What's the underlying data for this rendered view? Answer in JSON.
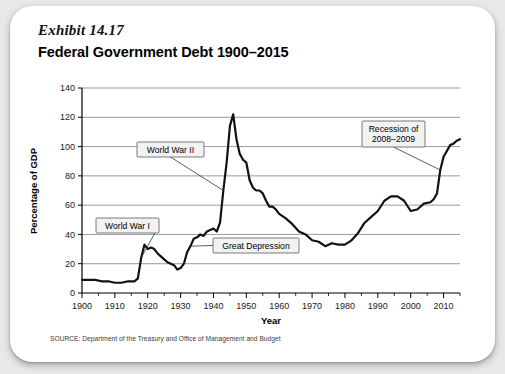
{
  "figure": {
    "exhibit_label": "Exhibit 14.17",
    "title": "Federal Government Debt 1900–2015",
    "source_note": "SOURCE: Department of the Treasury and Office of Management and Budget"
  },
  "chart_data": {
    "type": "line",
    "title": "Federal Government Debt 1900–2015",
    "xlabel": "Year",
    "ylabel": "Percentage of GDP",
    "xlim": [
      1900,
      2015
    ],
    "ylim": [
      0,
      140
    ],
    "ytick_labels": [
      "0",
      "20",
      "40",
      "60",
      "80",
      "100",
      "120",
      "140"
    ],
    "yticks": [
      0,
      20,
      40,
      60,
      80,
      100,
      120,
      140
    ],
    "xtick_labels": [
      "1900",
      "1910",
      "1920",
      "1930",
      "1940",
      "1950",
      "1960",
      "1970",
      "1980",
      "1990",
      "2000",
      "2010"
    ],
    "xticks": [
      1900,
      1910,
      1920,
      1930,
      1940,
      1950,
      1960,
      1970,
      1980,
      1990,
      2000,
      2010
    ],
    "x_minor_tick_step": 5,
    "grid": "horizontal",
    "legend": "none",
    "series": [
      {
        "name": "Federal Government Debt as Percentage of GDP",
        "x": [
          1900,
          1902,
          1904,
          1906,
          1908,
          1910,
          1912,
          1914,
          1916,
          1917,
          1918,
          1919,
          1920,
          1921,
          1922,
          1923,
          1924,
          1925,
          1926,
          1927,
          1928,
          1929,
          1930,
          1931,
          1932,
          1933,
          1934,
          1935,
          1936,
          1937,
          1938,
          1939,
          1940,
          1941,
          1942,
          1943,
          1944,
          1945,
          1946,
          1947,
          1948,
          1949,
          1950,
          1951,
          1952,
          1953,
          1954,
          1955,
          1956,
          1957,
          1958,
          1959,
          1960,
          1962,
          1964,
          1966,
          1968,
          1970,
          1972,
          1974,
          1976,
          1978,
          1980,
          1982,
          1984,
          1986,
          1988,
          1990,
          1992,
          1994,
          1996,
          1998,
          2000,
          2002,
          2004,
          2006,
          2007,
          2008,
          2009,
          2010,
          2011,
          2012,
          2013,
          2014,
          2015
        ],
        "y": [
          9,
          9,
          9,
          8,
          8,
          7,
          7,
          8,
          8,
          10,
          24,
          33,
          30,
          31,
          30,
          27,
          25,
          23,
          21,
          20,
          19,
          16,
          17,
          20,
          28,
          32,
          37,
          38,
          40,
          39,
          42,
          43,
          44,
          42,
          48,
          70,
          89,
          114,
          122,
          105,
          95,
          91,
          89,
          77,
          72,
          70,
          70,
          68,
          63,
          59,
          59,
          57,
          54,
          51,
          47,
          42,
          40,
          36,
          35,
          32,
          34,
          33,
          33,
          36,
          41,
          48,
          52,
          56,
          63,
          66,
          66,
          63,
          56,
          57,
          61,
          62,
          64,
          68,
          84,
          93,
          97,
          101,
          102,
          104,
          105
        ]
      }
    ],
    "annotations": [
      {
        "id": "world-war-i",
        "text": "World War I",
        "target_x": 1918,
        "target_y": 24
      },
      {
        "id": "world-war-ii",
        "text": "World War II",
        "target_x": 1943,
        "target_y": 70
      },
      {
        "id": "great-depression",
        "text": "Great Depression",
        "target_x": 1933,
        "target_y": 32
      },
      {
        "id": "recession-2008-2009",
        "line1": "Recession of",
        "line2": "2008–2009",
        "target_x": 2009,
        "target_y": 84
      }
    ]
  }
}
